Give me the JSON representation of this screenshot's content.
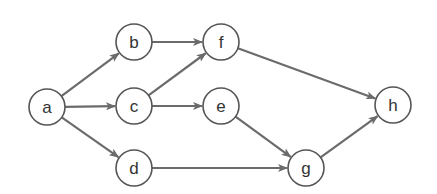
{
  "diagram": {
    "type": "directed-graph",
    "node_radius": 18,
    "colors": {
      "edge": "#6b6b6b",
      "node_stroke": "#555555",
      "node_fill": "#ffffff",
      "label": "#333333"
    },
    "nodes": [
      {
        "id": "a",
        "label": "a",
        "x": 47,
        "y": 107
      },
      {
        "id": "b",
        "label": "b",
        "x": 134,
        "y": 42
      },
      {
        "id": "c",
        "label": "c",
        "x": 134,
        "y": 106
      },
      {
        "id": "d",
        "label": "d",
        "x": 134,
        "y": 168
      },
      {
        "id": "f",
        "label": "f",
        "x": 221,
        "y": 42
      },
      {
        "id": "e",
        "label": "e",
        "x": 221,
        "y": 106
      },
      {
        "id": "g",
        "label": "g",
        "x": 306,
        "y": 168
      },
      {
        "id": "h",
        "label": "h",
        "x": 393,
        "y": 105
      }
    ],
    "edges": [
      {
        "from": "a",
        "to": "b"
      },
      {
        "from": "a",
        "to": "c"
      },
      {
        "from": "a",
        "to": "d"
      },
      {
        "from": "b",
        "to": "f"
      },
      {
        "from": "c",
        "to": "f"
      },
      {
        "from": "c",
        "to": "e"
      },
      {
        "from": "f",
        "to": "h"
      },
      {
        "from": "e",
        "to": "g"
      },
      {
        "from": "d",
        "to": "g"
      },
      {
        "from": "g",
        "to": "h"
      }
    ]
  }
}
